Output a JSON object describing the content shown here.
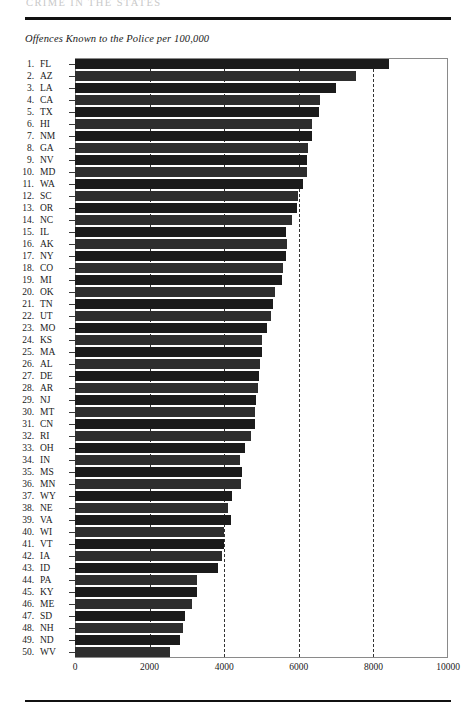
{
  "page": {
    "running_header": "CRIME IN THE STATES"
  },
  "figure": {
    "caption": "Offences Known to the Police per 100,000"
  },
  "chart_data": {
    "type": "bar",
    "orientation": "horizontal",
    "title": "Offences Known to the Police per 100,000",
    "xlabel": "",
    "ylabel": "",
    "xlim": [
      0,
      10000
    ],
    "grid": true,
    "gridlines": [
      2000,
      4000,
      6000,
      8000
    ],
    "xticks": [
      0,
      2000,
      4000,
      6000,
      8000,
      10000
    ],
    "xtick_labels": [
      "0",
      "2000",
      "4000",
      "6000",
      "8000",
      "10000"
    ],
    "legend": null,
    "categories": [
      "FL",
      "AZ",
      "LA",
      "CA",
      "TX",
      "HI",
      "NM",
      "GA",
      "NV",
      "MD",
      "WA",
      "SC",
      "OR",
      "NC",
      "IL",
      "AK",
      "NY",
      "CO",
      "MI",
      "OK",
      "TN",
      "UT",
      "MO",
      "KS",
      "MA",
      "AL",
      "DE",
      "AR",
      "NJ",
      "MT",
      "CN",
      "RI",
      "OH",
      "IN",
      "MS",
      "MN",
      "WY",
      "NE",
      "VA",
      "WI",
      "VT",
      "IA",
      "ID",
      "PA",
      "KY",
      "ME",
      "SD",
      "NH",
      "ND",
      "WV"
    ],
    "values": [
      8420,
      7540,
      7000,
      6570,
      6550,
      6350,
      6350,
      6250,
      6220,
      6220,
      6110,
      5980,
      5950,
      5820,
      5660,
      5680,
      5660,
      5580,
      5550,
      5360,
      5310,
      5250,
      5150,
      5010,
      5010,
      4960,
      4930,
      4900,
      4850,
      4830,
      4830,
      4720,
      4560,
      4420,
      4480,
      4450,
      4210,
      4100,
      4180,
      4000,
      4000,
      3940,
      3830,
      3270,
      3270,
      3140,
      2950,
      2890,
      2820,
      2550
    ],
    "rows": [
      {
        "rank": "1.",
        "state": "FL",
        "value": 8420
      },
      {
        "rank": "2.",
        "state": "AZ",
        "value": 7540
      },
      {
        "rank": "3.",
        "state": "LA",
        "value": 7000
      },
      {
        "rank": "4.",
        "state": "CA",
        "value": 6570
      },
      {
        "rank": "5.",
        "state": "TX",
        "value": 6550
      },
      {
        "rank": "6.",
        "state": "HI",
        "value": 6350
      },
      {
        "rank": "7.",
        "state": "NM",
        "value": 6350
      },
      {
        "rank": "8.",
        "state": "GA",
        "value": 6250
      },
      {
        "rank": "9.",
        "state": "NV",
        "value": 6220
      },
      {
        "rank": "10.",
        "state": "MD",
        "value": 6220
      },
      {
        "rank": "11.",
        "state": "WA",
        "value": 6110
      },
      {
        "rank": "12.",
        "state": "SC",
        "value": 5980
      },
      {
        "rank": "13.",
        "state": "OR",
        "value": 5950
      },
      {
        "rank": "14.",
        "state": "NC",
        "value": 5820
      },
      {
        "rank": "15.",
        "state": "IL",
        "value": 5660
      },
      {
        "rank": "16.",
        "state": "AK",
        "value": 5680
      },
      {
        "rank": "17.",
        "state": "NY",
        "value": 5660
      },
      {
        "rank": "18.",
        "state": "CO",
        "value": 5580
      },
      {
        "rank": "19.",
        "state": "MI",
        "value": 5550
      },
      {
        "rank": "20.",
        "state": "OK",
        "value": 5360
      },
      {
        "rank": "21.",
        "state": "TN",
        "value": 5310
      },
      {
        "rank": "22.",
        "state": "UT",
        "value": 5250
      },
      {
        "rank": "23.",
        "state": "MO",
        "value": 5150
      },
      {
        "rank": "24.",
        "state": "KS",
        "value": 5010
      },
      {
        "rank": "25.",
        "state": "MA",
        "value": 5010
      },
      {
        "rank": "26.",
        "state": "AL",
        "value": 4960
      },
      {
        "rank": "27.",
        "state": "DE",
        "value": 4930
      },
      {
        "rank": "28.",
        "state": "AR",
        "value": 4900
      },
      {
        "rank": "29.",
        "state": "NJ",
        "value": 4850
      },
      {
        "rank": "30.",
        "state": "MT",
        "value": 4830
      },
      {
        "rank": "31.",
        "state": "CN",
        "value": 4830
      },
      {
        "rank": "32.",
        "state": "RI",
        "value": 4720
      },
      {
        "rank": "33.",
        "state": "OH",
        "value": 4560
      },
      {
        "rank": "34.",
        "state": "IN",
        "value": 4420
      },
      {
        "rank": "35.",
        "state": "MS",
        "value": 4480
      },
      {
        "rank": "36.",
        "state": "MN",
        "value": 4450
      },
      {
        "rank": "37.",
        "state": "WY",
        "value": 4210
      },
      {
        "rank": "38.",
        "state": "NE",
        "value": 4100
      },
      {
        "rank": "39.",
        "state": "VA",
        "value": 4180
      },
      {
        "rank": "40.",
        "state": "WI",
        "value": 4000
      },
      {
        "rank": "41.",
        "state": "VT",
        "value": 4000
      },
      {
        "rank": "42.",
        "state": "IA",
        "value": 3940
      },
      {
        "rank": "43.",
        "state": "ID",
        "value": 3830
      },
      {
        "rank": "44.",
        "state": "PA",
        "value": 3270
      },
      {
        "rank": "45.",
        "state": "KY",
        "value": 3270
      },
      {
        "rank": "46.",
        "state": "ME",
        "value": 3140
      },
      {
        "rank": "47.",
        "state": "SD",
        "value": 2950
      },
      {
        "rank": "48.",
        "state": "NH",
        "value": 2890
      },
      {
        "rank": "49.",
        "state": "ND",
        "value": 2820
      },
      {
        "rank": "50.",
        "state": "WV",
        "value": 2550
      }
    ]
  }
}
